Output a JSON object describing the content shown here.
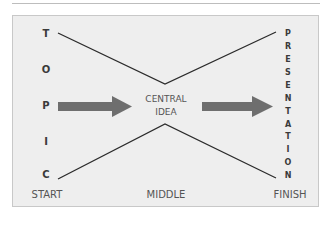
{
  "diagram": {
    "topic_letters": [
      "T",
      "O",
      "P",
      "I",
      "C"
    ],
    "presentation_letters": [
      "P",
      "R",
      "E",
      "S",
      "E",
      "N",
      "T",
      "A",
      "T",
      "I",
      "O",
      "N"
    ],
    "center": {
      "line1": "CENTRAL",
      "line2": "IDEA"
    },
    "stages": {
      "start": "START",
      "middle": "MIDDLE",
      "finish": "FINISH"
    },
    "colors": {
      "background": "#eeeeee",
      "line": "#2b2b2b",
      "arrow": "#6e6e6e",
      "text": "#555555",
      "letters": "#3a3a3a"
    }
  }
}
